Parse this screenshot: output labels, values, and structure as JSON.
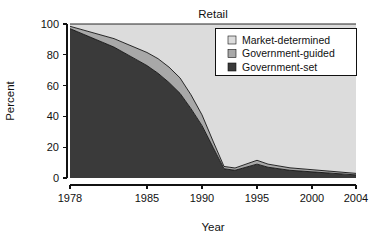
{
  "chart_data": {
    "type": "area",
    "title": "Retail",
    "xlabel": "Year",
    "ylabel": "Percent",
    "stacked": true,
    "grid": false,
    "legend_position": "top-right",
    "xlim": [
      1978,
      2004
    ],
    "ylim": [
      0,
      100
    ],
    "xticks": [
      1978,
      1985,
      1990,
      1995,
      2000,
      2004
    ],
    "xtick_labels": [
      "1978",
      "1985",
      "1990",
      "1995",
      "2000",
      "2004"
    ],
    "yticks": [
      0,
      20,
      40,
      60,
      80,
      100
    ],
    "ytick_labels": [
      "0",
      "20",
      "40",
      "60",
      "80",
      "100"
    ],
    "x": [
      1978,
      1979,
      1980,
      1981,
      1982,
      1983,
      1984,
      1985,
      1986,
      1987,
      1988,
      1989,
      1990,
      1991,
      1992,
      1993,
      1994,
      1995,
      1996,
      1997,
      1998,
      1999,
      2000,
      2001,
      2002,
      2003,
      2004
    ],
    "series": [
      {
        "name": "Government-set",
        "color": "#3a3a3a",
        "values": [
          97,
          94,
          91,
          88,
          85,
          81,
          77,
          73,
          68,
          62,
          55,
          45,
          34,
          20,
          6,
          5,
          7,
          9,
          7,
          6,
          5,
          4.5,
          4,
          3.5,
          3,
          2.5,
          2
        ]
      },
      {
        "name": "Government-guided",
        "color": "#a8a8a8",
        "values": [
          1.5,
          2.5,
          3.5,
          4.5,
          5.5,
          6.5,
          7.5,
          8.5,
          9.5,
          10,
          10,
          9,
          7,
          4,
          1.5,
          1.5,
          2,
          2.5,
          2,
          1.8,
          1.6,
          1.5,
          1.4,
          1.3,
          1.2,
          1.1,
          1
        ]
      },
      {
        "name": "Market-determined",
        "color": "#dcdcdc",
        "values": [
          1.5,
          3.5,
          5.5,
          7.5,
          9.5,
          12.5,
          15.5,
          18.5,
          22.5,
          28,
          35,
          46,
          59,
          76,
          92.5,
          93.5,
          91,
          88.5,
          91,
          92.2,
          93.4,
          94,
          94.6,
          95.2,
          95.8,
          96.4,
          97
        ]
      }
    ],
    "legend": [
      {
        "label": "Market-determined",
        "color": "#dcdcdc"
      },
      {
        "label": "Government-guided",
        "color": "#a8a8a8"
      },
      {
        "label": "Government-set",
        "color": "#3a3a3a"
      }
    ]
  },
  "colors": {
    "market_determined": "#dcdcdc",
    "government_guided": "#a8a8a8",
    "government_set": "#3a3a3a",
    "axis": "#111111",
    "background": "#ffffff"
  }
}
